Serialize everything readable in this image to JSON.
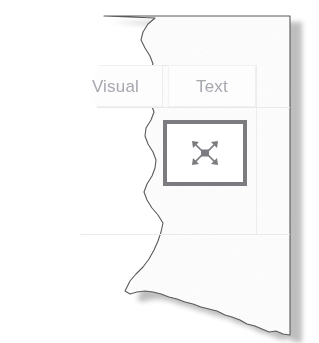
{
  "window": {
    "title": "Visual / Text panel cut-out",
    "paper_color": "#fdfdfd",
    "shadow_color": "#8a8a8a"
  },
  "tabs": {
    "items": [
      {
        "id": "visual",
        "label": "Visual",
        "selected": false
      },
      {
        "id": "text",
        "label": "Text",
        "selected": false
      }
    ],
    "text_color": "#a6a8ae",
    "border_color": "#f0f0f3"
  },
  "toolbar": {
    "buttons": [
      {
        "id": "fit-to-screen",
        "icon": "expand-arrows-icon",
        "label": "",
        "border_color": "#7b7b80",
        "icon_color": "#7b7b80",
        "background": "#ffffff"
      }
    ]
  },
  "background": {
    "rules": [
      {
        "id": "tabstrip-top",
        "orientation": "horizontal"
      },
      {
        "id": "tabstrip-bottom",
        "orientation": "horizontal"
      },
      {
        "id": "panel-divider",
        "orientation": "horizontal"
      },
      {
        "id": "column-divider",
        "orientation": "vertical"
      }
    ],
    "rule_color": "#e9e9ec"
  }
}
